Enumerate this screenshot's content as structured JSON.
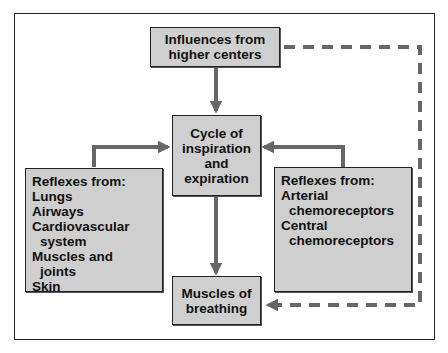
{
  "diagram": {
    "type": "flowchart",
    "nodes": {
      "higher_centers": {
        "lines": [
          "Influences from",
          "higher centers"
        ]
      },
      "cycle": {
        "lines": [
          "Cycle of",
          "inspiration",
          "and",
          "expiration"
        ]
      },
      "muscles": {
        "lines": [
          "Muscles of",
          "breathing"
        ]
      },
      "left_reflexes": {
        "lines": [
          "Reflexes from:",
          "Lungs",
          "Airways",
          "Cardiovascular",
          "system",
          "Muscles and",
          "joints",
          "Skin"
        ]
      },
      "right_reflexes": {
        "lines": [
          "Reflexes from:",
          "Arterial",
          "chemoreceptors",
          "Central",
          "chemoreceptors"
        ]
      }
    },
    "edges": [
      {
        "from": "higher_centers",
        "to": "cycle",
        "style": "solid"
      },
      {
        "from": "left_reflexes",
        "to": "cycle",
        "style": "solid"
      },
      {
        "from": "right_reflexes",
        "to": "cycle",
        "style": "solid"
      },
      {
        "from": "cycle",
        "to": "muscles",
        "style": "solid"
      },
      {
        "from": "higher_centers",
        "to": "muscles",
        "style": "dashed"
      }
    ],
    "colors": {
      "box_fill": "#cfcfcf",
      "arrow": "#666666",
      "border": "#222222"
    }
  }
}
